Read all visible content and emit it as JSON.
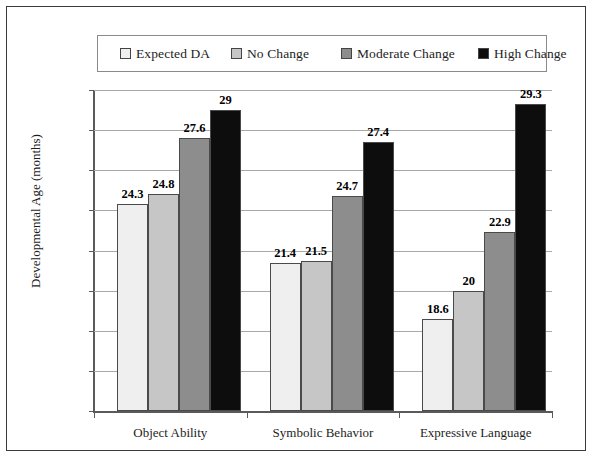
{
  "chart_data": {
    "type": "bar",
    "title": "",
    "xlabel": "",
    "ylabel": "Developmental Age (months)",
    "categories": [
      "Object Ability",
      "Symbolic Behavior",
      "Expressive Language"
    ],
    "series": [
      {
        "name": "Expected DA",
        "color": "#efefef",
        "values": [
          24.3,
          21.4,
          18.6
        ],
        "labels": [
          "24.3",
          "21.4",
          "18.6"
        ]
      },
      {
        "name": "No Change",
        "color": "#c6c6c6",
        "values": [
          24.8,
          21.5,
          20.0
        ],
        "labels": [
          "24.8",
          "21.5",
          "20"
        ]
      },
      {
        "name": "Moderate Change",
        "color": "#8d8d8d",
        "values": [
          27.6,
          24.7,
          22.9
        ],
        "labels": [
          "27.6",
          "24.7",
          "22.9"
        ]
      },
      {
        "name": "High Change",
        "color": "#0d0d0d",
        "values": [
          29.0,
          27.4,
          29.3
        ],
        "labels": [
          "29",
          "27.4",
          "29.3"
        ]
      }
    ],
    "ylim": [
      14,
      30
    ],
    "yticks": [
      14,
      16,
      18,
      20,
      22,
      24,
      26,
      28,
      30
    ],
    "ytick_labels": [
      "14",
      "16",
      "18",
      "20",
      "22",
      "24",
      "26",
      "28",
      "30"
    ],
    "grid": "horizontal",
    "legend_position": "top",
    "legend_entries": [
      "Expected DA",
      "No Change",
      "Moderate Change",
      "High Change"
    ],
    "value_labels_shown": true
  }
}
